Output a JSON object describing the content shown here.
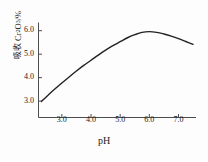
{
  "chart_data": {
    "type": "line",
    "title": "",
    "xlabel": "pH",
    "ylabel_parts": {
      "cjk": "吸收",
      "species_pre": "Cr",
      "species_sub1": "2",
      "species_mid": "O",
      "species_sub2": "3",
      "unit": "/%"
    },
    "ylabel": "吸收 Cr2O3/%",
    "xlim": [
      2.2,
      7.6
    ],
    "ylim": [
      2.3,
      6.35
    ],
    "xticks": [
      3.0,
      4.0,
      5.0,
      6.0,
      7.0
    ],
    "xtick_labels": [
      "3.0",
      "4.0",
      "5.0",
      "6.0",
      "7.0"
    ],
    "yticks": [
      3.0,
      4.0,
      5.0,
      6.0
    ],
    "ytick_labels": [
      "3.0",
      "4.0",
      "5.0",
      "6.0"
    ],
    "grid": false,
    "legend": null,
    "tick_direction": "in",
    "axis_color": "#4d4d4d",
    "line_color": "#222222",
    "line_width": 1.4,
    "series": [
      {
        "name": "Cr2O3 absorption vs pH",
        "x": [
          2.3,
          2.5,
          2.75,
          3.0,
          3.25,
          3.5,
          3.75,
          4.0,
          4.25,
          4.5,
          4.75,
          5.0,
          5.25,
          5.5,
          5.75,
          6.0,
          6.25,
          6.5,
          6.75,
          7.0,
          7.25,
          7.5
        ],
        "y": [
          2.98,
          3.22,
          3.5,
          3.77,
          4.03,
          4.28,
          4.52,
          4.74,
          4.96,
          5.17,
          5.36,
          5.53,
          5.7,
          5.83,
          5.93,
          5.96,
          5.93,
          5.86,
          5.77,
          5.66,
          5.54,
          5.42
        ]
      }
    ],
    "annotations": {
      "peak_x": 5.9,
      "peak_y": 5.96
    }
  }
}
